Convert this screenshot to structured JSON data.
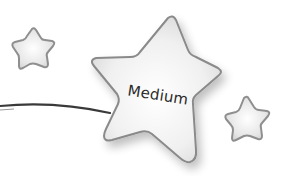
{
  "graphic": {
    "label": "Medium",
    "colors": {
      "star_fill_center": "#ffffff",
      "star_fill_edge": "#d6d6d6",
      "star_stroke": "#8a8a8a",
      "line": "#3a3a3a",
      "text": "#2a2a2a"
    },
    "shapes": [
      {
        "type": "star",
        "size": "small",
        "position": "top-left"
      },
      {
        "type": "star",
        "size": "large",
        "position": "center",
        "has_label": true
      },
      {
        "type": "star",
        "size": "small",
        "position": "right"
      },
      {
        "type": "connector-line",
        "from": "left-edge",
        "to": "large-star"
      }
    ]
  }
}
